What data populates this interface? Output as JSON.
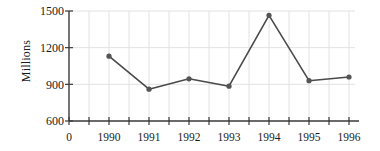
{
  "chart_data": {
    "type": "line",
    "title": "",
    "subtitle": "",
    "xlabel": "",
    "ylabel": "Millions",
    "categories": [
      "1990",
      "1991",
      "1992",
      "1993",
      "1994",
      "1995",
      "1996"
    ],
    "x": [
      1990,
      1991,
      1992,
      1993,
      1994,
      1995,
      1996
    ],
    "values": [
      1130,
      860,
      945,
      885,
      1465,
      930,
      960
    ],
    "series": [
      {
        "name": "Millions",
        "values": [
          1130,
          860,
          945,
          885,
          1465,
          930,
          960
        ]
      }
    ],
    "ylim": [
      600,
      1500
    ],
    "y_ticks": [
      600,
      900,
      1200,
      1500
    ],
    "y_tick_labels": [
      "600",
      "900",
      "1200",
      "1500"
    ],
    "x_axis_origin_label": "0",
    "x_tick_labels": [
      "0",
      "1990",
      "1991",
      "1992",
      "1993",
      "1994",
      "1995",
      "1996"
    ],
    "grid": true,
    "grid_color": "#e2e2e2",
    "legend": "none",
    "line_color": "#4a4a4a",
    "marker_color": "#545454",
    "axis_color": "#3a3a3a",
    "marker": "circle",
    "minor_x_ticks_between_years": 1
  },
  "layout": {
    "plot_left": 69,
    "plot_right": 355,
    "plot_top": 11,
    "plot_bottom": 121,
    "x_tick_spacing_px": 20,
    "year_spacing_px": 40,
    "first_year_x_px": 109
  }
}
